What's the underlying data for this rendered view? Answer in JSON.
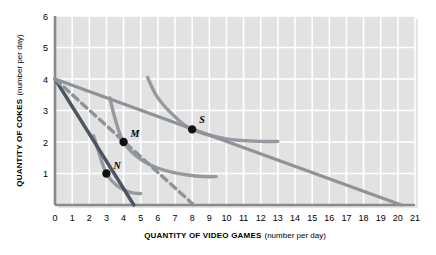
{
  "chart_data": {
    "type": "line",
    "title": "",
    "xlabel": "QUANTITY OF VIDEO GAMES",
    "xlabel_sub": "(number per day)",
    "ylabel": "QUANTITY OF COKES",
    "ylabel_sub": "(number per day)",
    "xlim": [
      0,
      21
    ],
    "ylim": [
      0,
      6
    ],
    "xticks": [
      "0",
      "1",
      "2",
      "3",
      "4",
      "5",
      "6",
      "7",
      "8",
      "9",
      "10",
      "11",
      "12",
      "13",
      "14",
      "15",
      "16",
      "17",
      "18",
      "19",
      "20",
      "21"
    ],
    "yticks": [
      "1",
      "2",
      "3",
      "4",
      "5",
      "6"
    ],
    "grid": true,
    "legend": "none",
    "colors": {
      "plot_background": "#e2e2e2",
      "gridline": "#ffffff",
      "axis": "#8a8a8a",
      "budget_line_dark": "#4d5560",
      "budget_line_dashed": "#8e939a",
      "budget_line_gray": "#8e939a",
      "indifference_curve": "#949a9f",
      "point": "#111111"
    },
    "points": [
      {
        "label": "M",
        "x": 4,
        "y": 2
      },
      {
        "label": "N",
        "x": 3,
        "y": 1
      },
      {
        "label": "S",
        "x": 8,
        "y": 2.4
      }
    ],
    "series": [
      {
        "name": "budget-line-dark-through-N",
        "style": "solid",
        "color": "#4d5560",
        "x": [
          0,
          4.6
        ],
        "y": [
          4,
          0
        ]
      },
      {
        "name": "budget-line-dashed-through-M",
        "style": "dashed",
        "color": "#8e939a",
        "x": [
          0,
          8.1
        ],
        "y": [
          4,
          0
        ]
      },
      {
        "name": "budget-line-gray-through-S",
        "style": "solid",
        "color": "#8e939a",
        "x": [
          0,
          20.2
        ],
        "y": [
          4,
          0
        ]
      },
      {
        "name": "indifference-curve-N",
        "style": "curve",
        "color": "#949a9f",
        "x": [
          2.25,
          2.6,
          3.0,
          3.6,
          4.4,
          5.0
        ],
        "y": [
          2.2,
          1.6,
          1.0,
          0.62,
          0.4,
          0.36
        ]
      },
      {
        "name": "indifference-curve-M",
        "style": "curve",
        "color": "#949a9f",
        "x": [
          3.2,
          3.5,
          4.0,
          5.0,
          6.4,
          8.2,
          9.4
        ],
        "y": [
          3.4,
          2.75,
          2.0,
          1.45,
          1.1,
          0.92,
          0.9
        ]
      },
      {
        "name": "indifference-curve-S",
        "style": "curve",
        "color": "#949a9f",
        "x": [
          5.4,
          6.0,
          7.0,
          8.0,
          10.0,
          12.0,
          13.0
        ],
        "y": [
          4.05,
          3.4,
          2.8,
          2.4,
          2.1,
          2.02,
          2.02
        ]
      }
    ]
  }
}
